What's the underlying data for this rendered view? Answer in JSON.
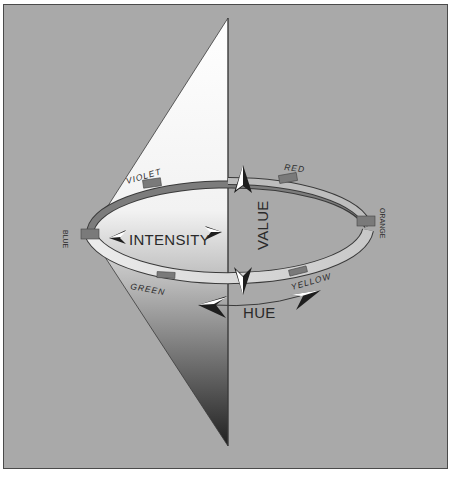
{
  "diagram": {
    "axes": {
      "intensity": "INTENSITY",
      "value": "VALUE",
      "hue": "HUE"
    },
    "hues": {
      "red": "RED",
      "orange": "ORANGE",
      "yellow": "YELLOW",
      "green": "GREEN",
      "blue": "BLUE",
      "violet": "VIOLET"
    },
    "colors": {
      "background": "#a9a9a9",
      "border": "#4a4a4a",
      "ring_fill": "#d8d8d8",
      "marker": "#7a7a7a",
      "text": "#2a2a2a"
    }
  }
}
